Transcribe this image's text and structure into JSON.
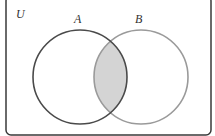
{
  "diagram": {
    "type": "venn",
    "universe_label": "U",
    "sets": [
      {
        "label": "A",
        "stroke": "#4a4a4a"
      },
      {
        "label": "B",
        "stroke": "#9a9a9a"
      }
    ],
    "shaded_region": "A ∩ B",
    "shade_color": "#d4d4d4",
    "frame_color": "#3a3a3a"
  }
}
